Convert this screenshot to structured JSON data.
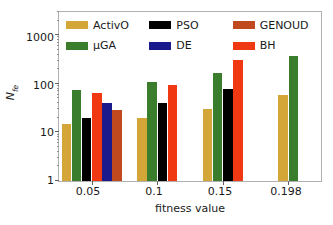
{
  "chart_data": {
    "type": "bar",
    "title": "",
    "xlabel": "fitness value",
    "ylabel": "N_fe",
    "ylabel_main": "N",
    "ylabel_sub": "fe",
    "yscale": "log",
    "ylim": [
      1,
      3000
    ],
    "ytick_labels": [
      "1",
      "10",
      "100",
      "1000"
    ],
    "ytick_values": [
      1,
      10,
      100,
      1000
    ],
    "grid": false,
    "legend_position": "upper-left-inside",
    "categories": [
      "0.05",
      "0.1",
      "0.15",
      "0.198"
    ],
    "series": [
      {
        "name": "ActivO",
        "color": "#d4a537",
        "values": [
          15,
          20,
          30,
          58
        ]
      },
      {
        "name": "μGA",
        "color": "#3a7d2c",
        "values": [
          75,
          108,
          165,
          425
        ]
      },
      {
        "name": "PSO",
        "color": "#000000",
        "values": [
          20,
          41,
          80,
          null
        ]
      },
      {
        "name": "BH",
        "color": "#f03812",
        "values": [
          65,
          95,
          310,
          null
        ]
      },
      {
        "name": "DE",
        "color": "#1a1a8c",
        "values": [
          40,
          null,
          null,
          null
        ]
      },
      {
        "name": "GENOUD",
        "color": "#c04a1e",
        "values": [
          29,
          null,
          null,
          null
        ]
      }
    ],
    "legend_order": [
      "ActivO",
      "μGA",
      "PSO",
      "DE",
      "GENOUD",
      "BH"
    ]
  },
  "legend": {
    "items": [
      {
        "label": "ActivO",
        "color": "#d4a537"
      },
      {
        "label": "μGA",
        "color": "#3a7d2c"
      },
      {
        "label": "PSO",
        "color": "#000000"
      },
      {
        "label": "DE",
        "color": "#1a1a8c"
      },
      {
        "label": "GENOUD",
        "color": "#c04a1e"
      },
      {
        "label": "BH",
        "color": "#f03812"
      }
    ]
  },
  "axes": {
    "x_label": "fitness value",
    "y_label_main": "N",
    "y_label_sub": "fe",
    "x_ticks": [
      "0.05",
      "0.1",
      "0.15",
      "0.198"
    ],
    "y_ticks": [
      "1000",
      "100",
      "10",
      "1"
    ]
  }
}
